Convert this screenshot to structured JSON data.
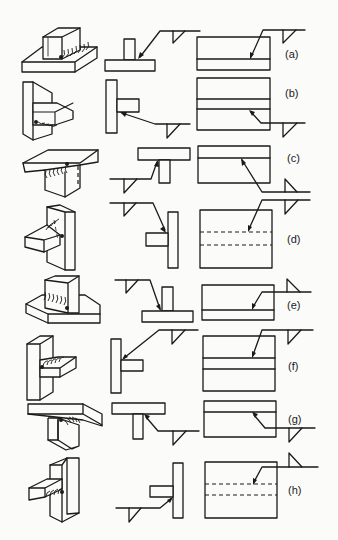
{
  "figure": {
    "columns": [
      "isometric-view",
      "section-view",
      "plan-view"
    ],
    "rows": [
      {
        "id": "a",
        "label": "(a)",
        "weld_side": "arrow side",
        "symbol_position": "below reference line"
      },
      {
        "id": "b",
        "label": "(b)",
        "weld_side": "arrow side",
        "symbol_position": "below reference line"
      },
      {
        "id": "c",
        "label": "(c)",
        "weld_side": "other side",
        "symbol_position": "above reference line"
      },
      {
        "id": "d",
        "label": "(d)",
        "weld_side": "arrow side",
        "symbol_position": "below reference line"
      },
      {
        "id": "e",
        "label": "(e)",
        "weld_side": "other side",
        "symbol_position": "above reference line"
      },
      {
        "id": "f",
        "label": "(f)",
        "weld_side": "arrow side",
        "symbol_position": "below reference line"
      },
      {
        "id": "g",
        "label": "(g)",
        "weld_side": "arrow side",
        "symbol_position": "below reference line"
      },
      {
        "id": "h",
        "label": "(h)",
        "weld_side": "other side",
        "symbol_position": "above reference line"
      }
    ]
  }
}
